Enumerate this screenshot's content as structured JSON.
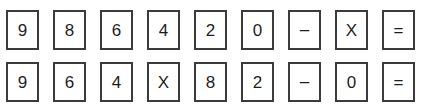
{
  "colors": {
    "background": "#ffffff",
    "box_fill": "#ffffff",
    "box_border": "#3b3b3b",
    "glyph": "#1e1e1e"
  },
  "keypad": {
    "rows": [
      {
        "row_index": 0,
        "keys": [
          {
            "label": "9",
            "kind": "digit"
          },
          {
            "label": "8",
            "kind": "digit"
          },
          {
            "label": "6",
            "kind": "digit"
          },
          {
            "label": "4",
            "kind": "digit"
          },
          {
            "label": "2",
            "kind": "digit"
          },
          {
            "label": "0",
            "kind": "digit"
          },
          {
            "label": "–",
            "kind": "minus"
          },
          {
            "label": "X",
            "kind": "times"
          },
          {
            "label": "=",
            "kind": "equals"
          }
        ]
      },
      {
        "row_index": 1,
        "keys": [
          {
            "label": "9",
            "kind": "digit"
          },
          {
            "label": "6",
            "kind": "digit"
          },
          {
            "label": "4",
            "kind": "digit"
          },
          {
            "label": "X",
            "kind": "times"
          },
          {
            "label": "8",
            "kind": "digit"
          },
          {
            "label": "2",
            "kind": "digit"
          },
          {
            "label": "–",
            "kind": "minus"
          },
          {
            "label": "0",
            "kind": "digit"
          },
          {
            "label": "=",
            "kind": "equals"
          }
        ]
      }
    ]
  }
}
